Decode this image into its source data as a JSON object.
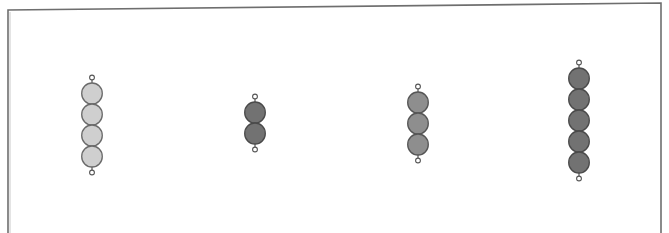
{
  "diagram": {
    "frame": {
      "stroke_color": "#6e6e6e"
    },
    "strings": [
      {
        "id": "string-1",
        "bead_count": 4,
        "fill_color": "#cfcfcf",
        "stroke_color": "#6a6a6a",
        "center_x": 92,
        "top_y": 83
      },
      {
        "id": "string-2",
        "bead_count": 2,
        "fill_color": "#727272",
        "stroke_color": "#4a4a4a",
        "center_x": 255,
        "top_y": 102
      },
      {
        "id": "string-3",
        "bead_count": 3,
        "fill_color": "#8e8e8e",
        "stroke_color": "#555555",
        "center_x": 418,
        "top_y": 92
      },
      {
        "id": "string-4",
        "bead_count": 5,
        "fill_color": "#727272",
        "stroke_color": "#4a4a4a",
        "center_x": 579,
        "top_y": 68
      }
    ],
    "bead_diameter": 21
  }
}
